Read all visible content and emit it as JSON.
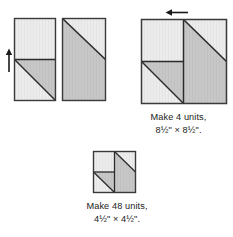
{
  "figure": {
    "colors": {
      "background": "#ffffff",
      "fabric_light": "#ebebeb",
      "fabric_medium": "#c6c6c6",
      "outline": "#3a3a3a",
      "seam_line": "#2b2b2b",
      "arrow": "#1a1a1a"
    },
    "arrows": [
      {
        "name": "press-arrow-up",
        "direction": "up",
        "label": ""
      },
      {
        "name": "press-arrow-left",
        "direction": "left",
        "label": ""
      }
    ],
    "units": [
      {
        "name": "left-rectangle",
        "description": "Rectangle, light top half, half-square-triangle bottom half",
        "shading": [
          "light",
          "light",
          "medium"
        ]
      },
      {
        "name": "right-rectangle",
        "description": "Rectangle with diagonal: light upper right triangle, medium lower left",
        "shading": [
          "light",
          "medium"
        ]
      },
      {
        "name": "assembled-square-large",
        "description": "Two rectangles joined into a square unit"
      },
      {
        "name": "assembled-square-small",
        "description": "Smaller version of the assembled square unit"
      }
    ]
  },
  "captions": {
    "large_unit": {
      "line1": "Make 4 units,",
      "line2": "8½\" × 8½\"."
    },
    "small_unit": {
      "line1": "Make 48 units,",
      "line2": "4½\" × 4½\"."
    }
  }
}
